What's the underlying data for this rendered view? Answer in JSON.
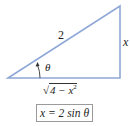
{
  "diagram": {
    "type": "right-triangle",
    "colors": {
      "triangle": "#8fa8d8",
      "text": "#222222",
      "box_border": "#9a9a9a",
      "arrow": "#333333"
    },
    "vertices": {
      "angle_vertex": [
        8,
        78
      ],
      "right_angle": [
        120,
        78
      ],
      "top": [
        120,
        6
      ]
    },
    "labels": {
      "hypotenuse": "2",
      "opposite": "x",
      "angle": "θ",
      "adjacent_radical_symbol": "√",
      "adjacent_radicand": "4 − x",
      "adjacent_exponent": "2"
    },
    "formula": "x = 2 sin θ"
  }
}
